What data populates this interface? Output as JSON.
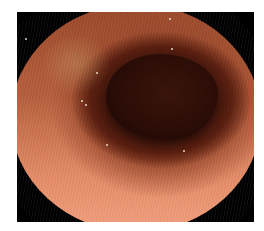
{
  "image": {
    "description": "Endoscopic view of colonic lumen with reddish-orange mucosa and dark central lumen opening",
    "colors": {
      "mucosa_light": "#f0a080",
      "mucosa_mid": "#b6603f",
      "mucosa_dark": "#9a4a2c",
      "lumen": "#2e0d07",
      "corner_mask": "#000000",
      "background": "#ffffff"
    }
  }
}
